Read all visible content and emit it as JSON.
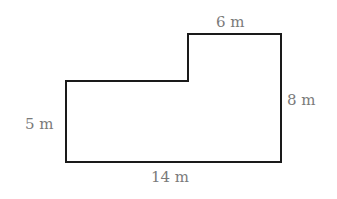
{
  "diagram": {
    "type": "composite-rectangle-floor-plan",
    "shape": {
      "description": "L-shaped composite figure made of a tall right rectangle and a shorter left rectangle",
      "stroke_color": "#1a1a1a",
      "stroke_width": 2,
      "points": [
        [
          66,
          81
        ],
        [
          188,
          81
        ],
        [
          188,
          34
        ],
        [
          281,
          34
        ],
        [
          281,
          162
        ],
        [
          66,
          162
        ]
      ]
    },
    "labels": {
      "top": "6 m",
      "right": "8 m",
      "left": "5 m",
      "bottom": "14 m"
    },
    "label_color": "#7a7a7a",
    "dimensions": {
      "top_width": 6,
      "right_height": 8,
      "left_height": 5,
      "bottom_width": 14,
      "unit": "m"
    }
  }
}
